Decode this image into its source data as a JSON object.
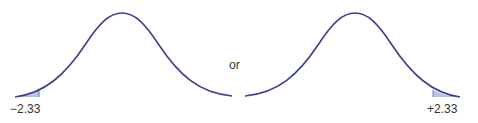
{
  "diagram": {
    "title": "",
    "connector_text": "or",
    "left_curve": {
      "type": "normal-distribution",
      "shaded_tail": "left",
      "critical_value_label": "−2.33"
    },
    "right_curve": {
      "type": "normal-distribution",
      "shaded_tail": "right",
      "critical_value_label": "+2.33"
    },
    "colors": {
      "curve": "#3a3f8f",
      "shade": "#b9c3e6",
      "text": "#333333"
    }
  }
}
